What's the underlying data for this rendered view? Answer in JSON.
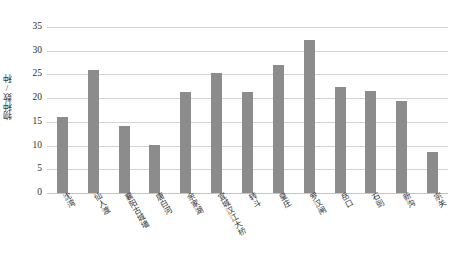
{
  "chart_data": {
    "type": "bar",
    "title": "",
    "subtitle": "",
    "xlabel": "",
    "ylabel": "物种数/种",
    "ylim": [
      0,
      35
    ],
    "yticks": [
      0,
      5,
      10,
      15,
      20,
      25,
      30,
      35
    ],
    "ytick_labels": [
      "0",
      "5",
      "10",
      "15",
      "20",
      "25",
      "30",
      "35"
    ],
    "grid": "horizontal",
    "legend": "none",
    "bar_color": "#8c8c8c",
    "gridline_color": "#d4d4d4",
    "categories": [
      "沈湾",
      "仙人渡",
      "襄阳古城墙",
      "唐白河",
      "余家湖",
      "宜城汉江大桥",
      "转斗",
      "皇庄",
      "罗汉闸",
      "岳口",
      "石剅",
      "新沟",
      "宗关"
    ],
    "values": [
      16.0,
      26.0,
      14.1,
      10.2,
      21.2,
      25.2,
      21.3,
      27.0,
      32.3,
      22.4,
      21.6,
      19.5,
      8.7
    ],
    "series": [
      {
        "name": "物种数",
        "values": [
          16.0,
          26.0,
          14.1,
          10.2,
          21.2,
          25.2,
          21.3,
          27.0,
          32.3,
          22.4,
          21.6,
          19.5,
          8.7
        ]
      }
    ]
  }
}
